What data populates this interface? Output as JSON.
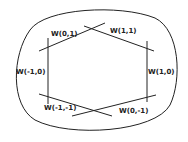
{
  "diagram": {
    "labels": {
      "top_left": "W(0,1)",
      "top_right": "W(1,1)",
      "left": "W(-1,0)",
      "right": "W(1,0)",
      "bottom_left": "W(-1,-1)",
      "bottom_right": "W(0,-1)"
    },
    "colors": {
      "stroke": "#222222",
      "background": "#ffffff"
    }
  }
}
